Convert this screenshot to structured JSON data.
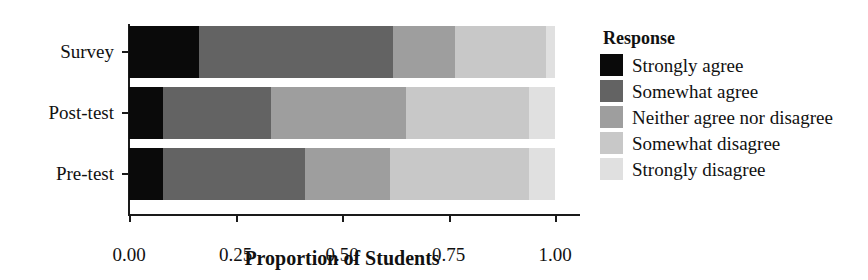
{
  "chart_data": {
    "type": "bar",
    "orientation": "horizontal",
    "stacked": true,
    "normalized": true,
    "title": "",
    "xlabel": "Proportion of Students",
    "ylabel": "",
    "xlim": [
      0.0,
      1.0
    ],
    "xticks": [
      0.0,
      0.25,
      0.5,
      0.75,
      1.0
    ],
    "xticklabels": [
      "0.00",
      "0.25",
      "0.50",
      "0.75",
      "1.00"
    ],
    "categories": [
      "Pre-test",
      "Post-test",
      "Survey"
    ],
    "categories_top_to_bottom": [
      "Survey",
      "Post-test",
      "Pre-test"
    ],
    "grid": false,
    "legend_title": "Response",
    "legend_position": "right",
    "series": [
      {
        "name": "Strongly disagree",
        "color": "#e0e0e0",
        "values": [
          0.061,
          0.061,
          0.021
        ]
      },
      {
        "name": "Somewhat disagree",
        "color": "#c8c8c8",
        "values": [
          0.326,
          0.289,
          0.213
        ]
      },
      {
        "name": "Neither agree nor disagree",
        "color": "#9e9e9e",
        "values": [
          0.2,
          0.317,
          0.146
        ]
      },
      {
        "name": "Somewhat agree",
        "color": "#636363",
        "values": [
          0.333,
          0.253,
          0.455
        ]
      },
      {
        "name": "Strongly agree",
        "color": "#0a0a0a",
        "values": [
          0.08,
          0.08,
          0.165
        ]
      }
    ],
    "cumulative_boundaries": {
      "Survey": [
        0.021,
        0.234,
        0.38,
        0.835,
        1.0
      ],
      "Post-test": [
        0.061,
        0.35,
        0.667,
        0.92,
        1.0
      ],
      "Pre-test": [
        0.061,
        0.387,
        0.587,
        0.92,
        1.0
      ]
    }
  },
  "legend": {
    "title": "Response",
    "items": [
      {
        "label": "Strongly agree",
        "color": "#0a0a0a"
      },
      {
        "label": "Somewhat agree",
        "color": "#636363"
      },
      {
        "label": "Neither agree nor disagree",
        "color": "#9e9e9e"
      },
      {
        "label": "Somewhat disagree",
        "color": "#c8c8c8"
      },
      {
        "label": "Strongly disagree",
        "color": "#e0e0e0"
      }
    ]
  },
  "axes": {
    "x_title": "Proportion of Students",
    "x_tick_labels": [
      "0.00",
      "0.25",
      "0.50",
      "0.75",
      "1.00"
    ],
    "y_tick_labels": [
      "Survey",
      "Post-test",
      "Pre-test"
    ]
  }
}
